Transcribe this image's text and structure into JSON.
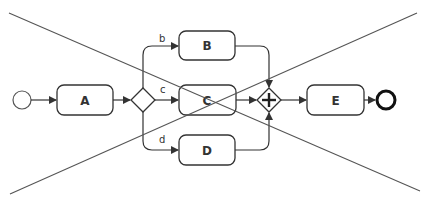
{
  "diagram": {
    "type": "bpmn-process",
    "crossed_out": true,
    "colors": {
      "stroke": "#333333",
      "cross": "#555555",
      "background": "#ffffff"
    },
    "start_event": {
      "label": ""
    },
    "tasks": {
      "a": {
        "label": "A"
      },
      "b": {
        "label": "B"
      },
      "c": {
        "label": "C"
      },
      "d": {
        "label": "D"
      },
      "e": {
        "label": "E"
      }
    },
    "gateways": {
      "split": {
        "kind": "exclusive"
      },
      "join": {
        "kind": "parallel",
        "symbol": "+"
      }
    },
    "flows": {
      "b": {
        "label": "b"
      },
      "c": {
        "label": "c"
      },
      "d": {
        "label": "d"
      }
    },
    "end_event": {
      "label": ""
    }
  }
}
